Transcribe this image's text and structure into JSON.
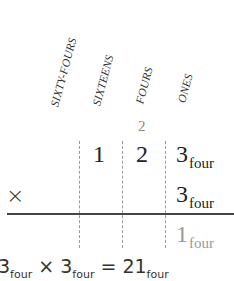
{
  "column_headers": [
    {
      "label": "SIXTY-FOURS"
    },
    {
      "label": "SIXTEENS"
    },
    {
      "label": "FOURS"
    },
    {
      "label": "ONES"
    }
  ],
  "carry": {
    "value": "2",
    "column": "FOURS"
  },
  "multiplicand": {
    "digits": [
      "1",
      "2",
      "3"
    ],
    "base_label": "four"
  },
  "multiplier": {
    "operator": "×",
    "digit": "3",
    "base_label": "four"
  },
  "partial_result": {
    "digit": "1",
    "base_label": "four"
  },
  "equation": {
    "left": "3",
    "left_base": "four",
    "operator": "× 3",
    "right_base": "four",
    "equals": "= 21",
    "result_base": "four"
  },
  "colors": {
    "text": "#222222",
    "muted": "#999999",
    "dashes": "#9a9a9a",
    "rule": "#444444"
  }
}
